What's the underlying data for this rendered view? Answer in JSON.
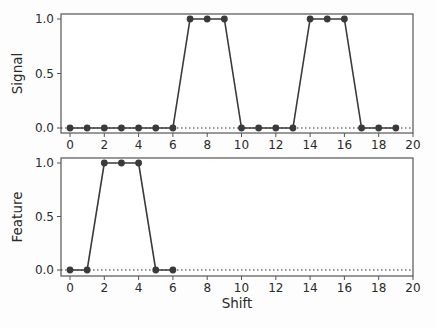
{
  "chart_data": [
    {
      "type": "line",
      "title": "",
      "xlabel": "",
      "ylabel": "Signal",
      "xlim": [
        -0.5,
        20
      ],
      "ylim": [
        -0.05,
        1.03
      ],
      "xticks": [
        0,
        2,
        4,
        6,
        8,
        10,
        12,
        14,
        16,
        18,
        20
      ],
      "yticks": [
        "0.0",
        "0.5",
        "1.0"
      ],
      "grid": false,
      "baseline": {
        "y": 0,
        "style": "dotted"
      },
      "series": [
        {
          "name": "Signal",
          "x": [
            0,
            1,
            2,
            3,
            4,
            5,
            6,
            7,
            8,
            9,
            10,
            11,
            12,
            13,
            14,
            15,
            16,
            17,
            18,
            19
          ],
          "values": [
            0,
            0,
            0,
            0,
            0,
            0,
            0,
            1,
            1,
            1,
            0,
            0,
            0,
            0,
            1,
            1,
            1,
            0,
            0,
            0
          ]
        }
      ]
    },
    {
      "type": "line",
      "title": "",
      "xlabel": "Shift",
      "ylabel": "Feature",
      "xlim": [
        -0.5,
        20
      ],
      "ylim": [
        -0.05,
        1.03
      ],
      "xticks": [
        0,
        2,
        4,
        6,
        8,
        10,
        12,
        14,
        16,
        18,
        20
      ],
      "yticks": [
        "0.0",
        "0.5",
        "1.0"
      ],
      "grid": false,
      "baseline": {
        "y": 0,
        "style": "dotted"
      },
      "series": [
        {
          "name": "Feature",
          "x": [
            0,
            1,
            2,
            3,
            4,
            5,
            6
          ],
          "values": [
            0,
            0,
            1,
            1,
            1,
            0,
            0
          ]
        }
      ]
    }
  ],
  "style": {
    "line_color": "#3a3a3a",
    "marker_color": "#3a3a3a",
    "spine_color": "#555555"
  }
}
